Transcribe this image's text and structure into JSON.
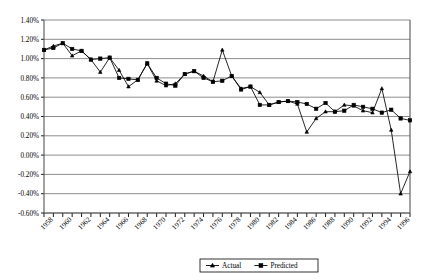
{
  "chart_data": {
    "type": "line",
    "title": "",
    "xlabel": "",
    "ylabel": "",
    "ylim": [
      -0.6,
      1.4
    ],
    "ytick_step": 0.2,
    "ytick_labels": [
      "1.40%",
      "1.20%",
      "1.00%",
      "0.80%",
      "0.60%",
      "0.40%",
      "0.20%",
      "0.00%",
      "-0.20%",
      "-0.40%",
      "-0.60%"
    ],
    "ytick_values": [
      1.4,
      1.2,
      1.0,
      0.8,
      0.6,
      0.4,
      0.2,
      0.0,
      -0.2,
      -0.4,
      -0.6
    ],
    "grid": true,
    "legend_position": "bottom",
    "x": [
      1957,
      1958,
      1959,
      1960,
      1961,
      1962,
      1963,
      1964,
      1965,
      1966,
      1967,
      1968,
      1969,
      1970,
      1971,
      1972,
      1973,
      1974,
      1975,
      1976,
      1977,
      1978,
      1979,
      1980,
      1981,
      1982,
      1983,
      1984,
      1985,
      1986,
      1987,
      1988,
      1989,
      1990,
      1991,
      1992,
      1993,
      1994,
      1995,
      1996
    ],
    "xtick_labels": [
      "1958",
      "1960",
      "1962",
      "1964",
      "1966",
      "1968",
      "1970",
      "1972",
      "1974",
      "1976",
      "1978",
      "1980",
      "1982",
      "1984",
      "1986",
      "1988",
      "1990",
      "1992",
      "1994",
      "1996"
    ],
    "xtick_values": [
      1958,
      1960,
      1962,
      1964,
      1966,
      1968,
      1970,
      1972,
      1974,
      1976,
      1978,
      1980,
      1982,
      1984,
      1986,
      1988,
      1990,
      1992,
      1994,
      1996
    ],
    "series": [
      {
        "name": "Actual",
        "marker": "triangle",
        "color": "#000000",
        "values": [
          1.09,
          1.13,
          1.16,
          1.03,
          1.08,
          0.99,
          0.86,
          1.01,
          0.88,
          0.71,
          0.78,
          0.95,
          0.77,
          0.72,
          0.74,
          0.84,
          0.87,
          0.82,
          0.76,
          1.09,
          0.82,
          0.69,
          0.71,
          0.65,
          0.52,
          0.55,
          0.56,
          0.53,
          0.24,
          0.38,
          0.45,
          0.45,
          0.52,
          0.51,
          0.46,
          0.44,
          0.69,
          0.26,
          -0.4,
          -0.17
        ]
      },
      {
        "name": "Predicted",
        "marker": "square",
        "color": "#000000",
        "values": [
          1.09,
          1.11,
          1.16,
          1.1,
          1.08,
          0.99,
          1.0,
          1.01,
          0.8,
          0.79,
          0.78,
          0.95,
          0.8,
          0.74,
          0.72,
          0.84,
          0.87,
          0.8,
          0.76,
          0.77,
          0.82,
          0.68,
          0.71,
          0.52,
          0.52,
          0.55,
          0.56,
          0.55,
          0.53,
          0.48,
          0.54,
          0.45,
          0.46,
          0.52,
          0.5,
          0.48,
          0.44,
          0.47,
          0.38,
          0.36
        ]
      }
    ]
  },
  "legend": {
    "items": [
      {
        "label": "Actual",
        "marker": "triangle"
      },
      {
        "label": "Predicted",
        "marker": "square"
      }
    ]
  }
}
